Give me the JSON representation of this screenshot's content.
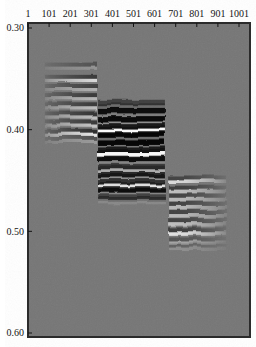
{
  "figure": {
    "page_bg": "#ffffff",
    "plot_bg": "#767676",
    "border_color": "#2b2b2b",
    "label_color": "#141414"
  },
  "chart_data": {
    "type": "heatmap",
    "title": "",
    "xlabel": "",
    "ylabel": "",
    "x_ticks": [
      1,
      101,
      201,
      301,
      401,
      501,
      601,
      701,
      801,
      901,
      1001
    ],
    "y_ticks": [
      0.3,
      0.4,
      0.5,
      0.6
    ],
    "x_range": [
      1,
      1053
    ],
    "y_range": [
      0.295,
      0.604
    ],
    "grid": false,
    "legend": false,
    "groups": [
      {
        "name": "left-reflector-band",
        "trace_start": 81,
        "trace_end": 328,
        "fade": "left",
        "dark_h": 4.0,
        "light_h": 3.2,
        "shade": 0,
        "shade_span": [
          0,
          0
        ],
        "events": [
          [
            0.338,
            0.3,
            0.2
          ],
          [
            0.35,
            0.5,
            0.7
          ],
          [
            0.359,
            0.45,
            0.4
          ],
          [
            0.368,
            0.5,
            0.45
          ],
          [
            0.377,
            0.5,
            0.5
          ],
          [
            0.386,
            0.55,
            0.5
          ],
          [
            0.394,
            0.5,
            0.55
          ],
          [
            0.403,
            0.6,
            0.8
          ],
          [
            0.41,
            0.3,
            0.25
          ]
        ]
      },
      {
        "name": "center-reflector-band",
        "trace_start": 333,
        "trace_end": 650,
        "fade": "uniform",
        "dark_h": 5.5,
        "light_h": 4.5,
        "shade": 0.24,
        "shade_span": [
          0.374,
          0.471
        ],
        "events": [
          [
            0.376,
            0.45,
            0.1
          ],
          [
            0.384,
            0.85,
            0.2
          ],
          [
            0.392,
            0.88,
            0.3
          ],
          [
            0.399,
            0.8,
            0.97
          ],
          [
            0.407,
            0.95,
            0.1
          ],
          [
            0.415,
            0.92,
            0.15
          ],
          [
            0.422,
            0.8,
            0.95
          ],
          [
            0.431,
            0.85,
            0.25
          ],
          [
            0.439,
            0.55,
            0.5
          ],
          [
            0.447,
            0.75,
            0.3
          ],
          [
            0.454,
            0.65,
            0.8
          ],
          [
            0.462,
            0.85,
            0.25
          ],
          [
            0.469,
            0.5,
            0.12
          ]
        ]
      },
      {
        "name": "right-reflector-band",
        "trace_start": 665,
        "trace_end": 940,
        "fade": "right",
        "dark_h": 4.0,
        "light_h": 3.5,
        "shade": 0,
        "shade_span": [
          0,
          0
        ],
        "events": [
          [
            0.449,
            0.45,
            0.75
          ],
          [
            0.459,
            0.5,
            0.55
          ],
          [
            0.467,
            0.45,
            0.5
          ],
          [
            0.475,
            0.45,
            0.5
          ],
          [
            0.483,
            0.45,
            0.5
          ],
          [
            0.491,
            0.45,
            0.55
          ],
          [
            0.5,
            0.5,
            0.8
          ],
          [
            0.509,
            0.3,
            0.35
          ],
          [
            0.515,
            0.18,
            0.18
          ]
        ]
      }
    ]
  }
}
